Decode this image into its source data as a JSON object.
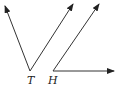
{
  "diagram": {
    "type": "geometry-angles",
    "angles": [
      {
        "vertex_label": "T",
        "vertex": [
          30,
          71
        ],
        "rays": [
          {
            "to": [
              5,
              6
            ]
          },
          {
            "to": [
              73,
              4
            ]
          }
        ]
      },
      {
        "vertex_label": "H",
        "vertex": [
          53,
          71
        ],
        "rays": [
          {
            "to": [
              99,
              4
            ]
          },
          {
            "to": [
              114,
              71
            ]
          }
        ]
      }
    ]
  },
  "labels": {
    "t": "T",
    "h": "H"
  },
  "colors": {
    "line": "#333333",
    "background": "#ffffff"
  }
}
